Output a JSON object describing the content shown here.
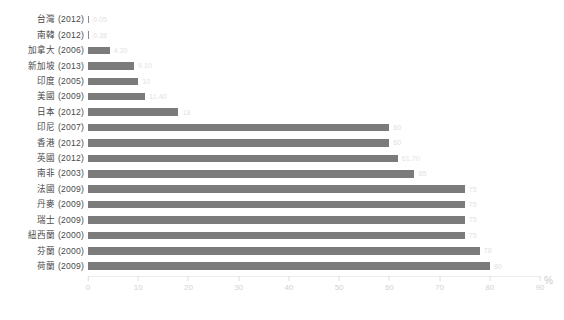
{
  "chart_data": {
    "type": "bar",
    "orientation": "horizontal",
    "title": "",
    "xlabel": "%",
    "ylabel": "",
    "xlim": [
      0,
      90
    ],
    "xticks": [
      0,
      10,
      20,
      30,
      40,
      50,
      60,
      70,
      80,
      90
    ],
    "grid": false,
    "legend": null,
    "bar_color": "#7b7b7b",
    "label_color": "#e2e2e2",
    "tick_color": "#d2d2d2",
    "categories": [
      "台灣 (2012)",
      "南韓 (2012)",
      "加拿大 (2006)",
      "新加坡 (2013)",
      "印度 (2005)",
      "美國 (2009)",
      "日本 (2012)",
      "印尼 (2007)",
      "香港 (2012)",
      "英國 (2012)",
      "南非 (2003)",
      "法國 (2009)",
      "丹麥 (2009)",
      "瑞士 (2009)",
      "紐西蘭 (2000)",
      "芬蘭 (2000)",
      "荷蘭 (2009)"
    ],
    "values": [
      0.05,
      0.38,
      4.3,
      9.1,
      10,
      11.4,
      18,
      60,
      60,
      61.7,
      65,
      75,
      75,
      75,
      75,
      78,
      80
    ],
    "value_labels": [
      "0.05",
      "0.38",
      "4.30",
      "9.10",
      "10",
      "11.40",
      "18",
      "60",
      "60",
      "61.70",
      "65",
      "75",
      "75",
      "75",
      "75",
      "78",
      "80"
    ]
  },
  "axis": {
    "unit": "%",
    "ticks": [
      "0",
      "10",
      "20",
      "30",
      "40",
      "50",
      "60",
      "70",
      "80",
      "90"
    ]
  }
}
